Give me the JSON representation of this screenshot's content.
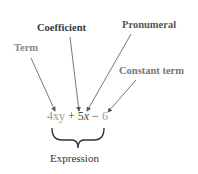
{
  "labels": {
    "term": "Term",
    "coefficient": "Coefficient",
    "pronumeral": "Pronumeral",
    "constant_term": "Constant term",
    "expression": "Expression"
  },
  "expression": {
    "term1": "4xy",
    "plus": " + ",
    "coef": "5",
    "pron": "x",
    "minus": " − ",
    "const": "6"
  },
  "colors": {
    "term_gray": "#9a9a9a",
    "dark": "#444444",
    "arrow": "#555555"
  }
}
